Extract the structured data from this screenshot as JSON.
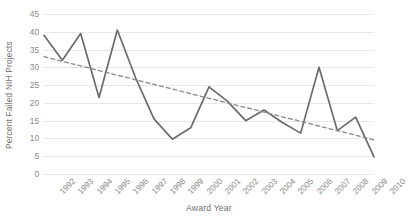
{
  "chart_data": {
    "type": "line",
    "title": "",
    "xlabel": "Award Year",
    "ylabel": "Percent Failed NIH  Projects",
    "x": [
      1992,
      1993,
      1994,
      1995,
      1996,
      1997,
      1998,
      1999,
      2000,
      2001,
      2002,
      2003,
      2004,
      2005,
      2006,
      2007,
      2008,
      2009,
      2010
    ],
    "categories": [
      "1992",
      "1993",
      "1994",
      "1995",
      "1996",
      "1997",
      "1998",
      "1999",
      "2000",
      "2001",
      "2002",
      "2003",
      "2004",
      "2005",
      "2006",
      "2007",
      "2008",
      "2009",
      "2010"
    ],
    "series": [
      {
        "name": "Percent Failed NIH Projects",
        "style": "solid",
        "color": "#6b6b6b",
        "values": [
          39.0,
          32.0,
          39.5,
          21.5,
          40.5,
          27.0,
          15.5,
          9.8,
          13.0,
          24.5,
          20.5,
          15.0,
          18.0,
          14.5,
          11.5,
          30.0,
          12.2,
          16.0,
          4.8
        ]
      },
      {
        "name": "Linear trendline",
        "style": "dashed",
        "color": "#8a8a8a",
        "values": [
          33.0,
          31.7,
          30.4,
          29.1,
          27.8,
          26.5,
          25.2,
          23.9,
          22.6,
          21.3,
          20.0,
          18.7,
          17.4,
          16.1,
          14.8,
          13.5,
          12.2,
          10.9,
          9.6
        ]
      }
    ],
    "ylim": [
      0,
      45
    ],
    "yticks": [
      0,
      5,
      10,
      15,
      20,
      25,
      30,
      35,
      40,
      45
    ],
    "ytick_labels": [
      "0",
      "5",
      "10",
      "15",
      "20",
      "25",
      "30",
      "35",
      "40",
      "45"
    ],
    "grid": "horizontal",
    "legend": "none",
    "axis_label_color": "#6e6e6e",
    "tick_label_color": "#8a8a8a",
    "gridline_color": "#e8e8e8",
    "background": "#ffffff"
  }
}
